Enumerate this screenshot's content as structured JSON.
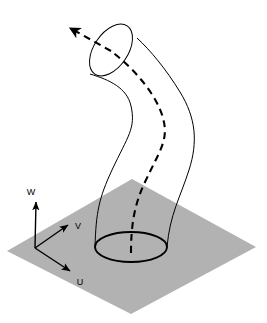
{
  "figure": {
    "background_color": "#ffffff",
    "plane": {
      "name": "ground-plane",
      "fill_color": "#b2b2b2",
      "shape": "parallelogram",
      "corners": [
        {
          "x": 7,
          "y": 251
        },
        {
          "x": 132,
          "y": 179
        },
        {
          "x": 256,
          "y": 247
        },
        {
          "x": 131,
          "y": 314
        }
      ]
    },
    "axes": {
      "origin": {
        "x": 35,
        "y": 248
      },
      "stroke_color": "#000000",
      "items": [
        {
          "id": "w-axis",
          "label": "W",
          "tip": {
            "x": 36,
            "y": 199
          },
          "label_pos": {
            "x": 31,
            "y": 195
          }
        },
        {
          "id": "v-axis",
          "label": "V",
          "tip": {
            "x": 71,
            "y": 223
          },
          "label_pos": {
            "x": 76,
            "y": 227
          }
        },
        {
          "id": "u-axis",
          "label": "U",
          "tip": {
            "x": 73,
            "y": 273
          },
          "label_pos": {
            "x": 78,
            "y": 283
          }
        }
      ]
    },
    "base_ellipse": {
      "name": "tube-base-ellipse",
      "center": {
        "x": 131,
        "y": 247
      },
      "rx": 36,
      "ry": 15,
      "rotation": 0,
      "stroke_color": "#000000",
      "stroke_width": 1.9,
      "fill": "none"
    },
    "top_ellipse": {
      "name": "tube-top-ellipse",
      "center": {
        "x": 111,
        "y": 50
      },
      "rx": 29,
      "ry": 17,
      "rotation": -56,
      "stroke_color": "#000000",
      "stroke_width": 1,
      "fill": "none"
    },
    "tube": {
      "name": "curved-tube",
      "stroke_color": "#000000",
      "stroke_width": 1,
      "fill": "none",
      "left_edge_path": "M 95,247 C 96,212 99,198 112,170 C 128,136 136,128 131,106 C 127,88 110,80 90,74",
      "right_edge_path": "M 167,247 C 170,214 180,198 189,170 C 198,142 196,118 180,92 C 166,69 150,50 137,38"
    },
    "centerline": {
      "name": "tube-centerline-dashed",
      "stroke_color": "#000000",
      "stroke_width": 2.1,
      "dash_pattern": "7 5",
      "path": "M 131,253 C 131,226 134,205 145,182 C 160,150 169,140 163,118 C 157,96 136,70 111,51",
      "arrow_segment_path": "M 111,51 L 70,28",
      "arrow_tip": {
        "x": 65,
        "y": 25
      },
      "has_arrowhead": true
    }
  }
}
